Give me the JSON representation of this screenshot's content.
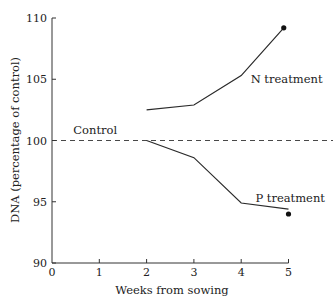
{
  "chart_data": {
    "type": "line",
    "title": "",
    "xlabel": "Weeks from sowing",
    "ylabel": "DNA (percentage of control)",
    "xlim": [
      0,
      5
    ],
    "ylim": [
      90,
      110
    ],
    "x_ticks": [
      0,
      1,
      2,
      3,
      4,
      5
    ],
    "y_ticks": [
      90,
      95,
      100,
      105,
      110
    ],
    "grid": false,
    "legend": "none (inline annotations)",
    "reference_line": {
      "label": "Control",
      "y": 100,
      "style": "dashed"
    },
    "series": [
      {
        "name": "N treatment",
        "x": [
          2,
          3,
          4,
          4.9
        ],
        "values": [
          102.5,
          102.9,
          105.3,
          109.2
        ],
        "end_marker": {
          "x": 4.9,
          "y": 109.2
        }
      },
      {
        "name": "P treatment",
        "x": [
          2,
          3,
          4,
          5
        ],
        "values": [
          100.0,
          98.6,
          94.9,
          94.4
        ],
        "end_marker": {
          "x": 5,
          "y": 94.0
        }
      }
    ],
    "annotations": [
      {
        "text": "Control",
        "x": 0.45,
        "y": 100.5
      },
      {
        "text": "N treatment",
        "x": 4.2,
        "y": 104.7
      },
      {
        "text": "P treatment",
        "x": 4.3,
        "y": 95.0
      }
    ]
  }
}
